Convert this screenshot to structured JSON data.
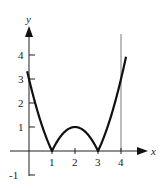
{
  "chart_data": {
    "type": "line",
    "title": "",
    "xlabel": "x",
    "ylabel": "y",
    "function": "y = |x^2 - 4x + 3|",
    "xlim": [
      -0.1,
      4.3
    ],
    "ylim": [
      -1,
      4.8
    ],
    "x_ticks": [
      1,
      2,
      3,
      4
    ],
    "x_tick_labels": [
      "1",
      "2",
      "3",
      "4"
    ],
    "y_ticks": [
      -1,
      1,
      2,
      3,
      4
    ],
    "y_tick_labels": [
      "-1",
      "1",
      "2",
      "3",
      "4"
    ],
    "grid": false,
    "reference_lines": [
      {
        "orientation": "vertical",
        "x": 4
      }
    ],
    "series": [
      {
        "name": "f(x)",
        "x": [
          -0.05,
          0,
          0.5,
          1,
          1.5,
          2,
          2.5,
          3,
          3.5,
          4,
          4.2
        ],
        "y": [
          3.2,
          3,
          1.25,
          0,
          0.75,
          1,
          0.75,
          0,
          1.25,
          3,
          4.44
        ]
      }
    ],
    "key_points": [
      {
        "x": 1,
        "y": 0,
        "label": "zero"
      },
      {
        "x": 2,
        "y": 1,
        "label": "local max"
      },
      {
        "x": 3,
        "y": 0,
        "label": "zero"
      }
    ],
    "colors": {
      "curve": "#111111",
      "axes": "#222222",
      "reference": "#555555"
    }
  }
}
